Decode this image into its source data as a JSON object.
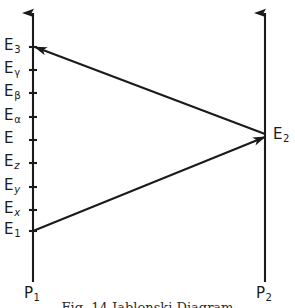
{
  "figure": {
    "type": "energy-level-transition-diagram",
    "width": 295,
    "height": 308,
    "background_color": "#ffffff",
    "ink_color": "#1a1a1a"
  },
  "axes": [
    {
      "id": "p1",
      "label_base": "P",
      "label_sub": "1",
      "x": 33,
      "top_y": 8,
      "bottom_y": 282,
      "arrow": "up",
      "label_x": 24,
      "label_y": 286
    },
    {
      "id": "p2",
      "label_base": "P",
      "label_sub": "2",
      "x": 265,
      "top_y": 8,
      "bottom_y": 282,
      "arrow": "up",
      "label_x": 256,
      "label_y": 286
    }
  ],
  "levels": [
    {
      "base": "E",
      "sub": "3",
      "sub_italic": false,
      "y": 47,
      "label_x": 4,
      "tick": true
    },
    {
      "base": "E",
      "sub": "γ",
      "sub_italic": false,
      "y": 70,
      "label_x": 4,
      "tick": true
    },
    {
      "base": "E",
      "sub": "β",
      "sub_italic": false,
      "y": 93,
      "label_x": 4,
      "tick": true
    },
    {
      "base": "E",
      "sub": "α",
      "sub_italic": false,
      "y": 117,
      "label_x": 4,
      "tick": true
    },
    {
      "base": "E",
      "sub": "",
      "sub_italic": false,
      "y": 140,
      "label_x": 4,
      "tick": true
    },
    {
      "base": "E",
      "sub": "z",
      "sub_italic": true,
      "y": 163,
      "label_x": 4,
      "tick": true
    },
    {
      "base": "E",
      "sub": "y",
      "sub_italic": true,
      "y": 187,
      "label_x": 4,
      "tick": true
    },
    {
      "base": "E",
      "sub": "x",
      "sub_italic": true,
      "y": 210,
      "label_x": 4,
      "tick": true
    },
    {
      "base": "E",
      "sub": "1",
      "sub_italic": false,
      "y": 231,
      "label_x": 4,
      "tick": true
    }
  ],
  "nodes": [
    {
      "id": "e2",
      "base": "E",
      "sub": "2",
      "x": 273,
      "y": 135
    }
  ],
  "transitions": [
    {
      "id": "upward-transition",
      "from_level": "E1",
      "to_node": "E2",
      "from": {
        "x": 33,
        "y": 231
      },
      "to": {
        "x": 265,
        "y": 137
      },
      "arrow_at": "end",
      "direction": "right-up"
    },
    {
      "id": "downward-transition",
      "from_node": "E2",
      "to_level": "E3",
      "from": {
        "x": 265,
        "y": 134
      },
      "to": {
        "x": 35,
        "y": 47
      },
      "arrow_at": "end",
      "direction": "left-up"
    }
  ],
  "caption": {
    "text": "Fig. 14 Jablonski Diagram",
    "visible_fragment": true
  }
}
